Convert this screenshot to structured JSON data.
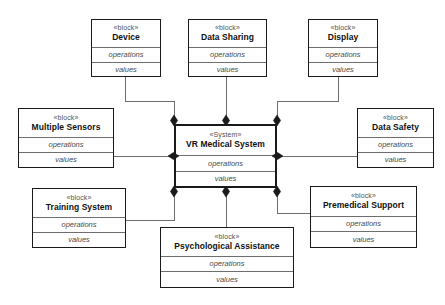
{
  "diagram": {
    "notation": "SysML Block Definition Diagram",
    "background_color": "#ffffff",
    "line_color": "#6e6e6e",
    "border_color": "#1a1a1a",
    "text_color": "#2b2b2b",
    "labels": {
      "stereotype_block": "«block»",
      "stereotype_system": "«System»",
      "operations": "operations",
      "values": "values"
    },
    "blocks": [
      {
        "id": "device",
        "stereotype": "«block»",
        "name": "Device",
        "operations": "operations",
        "values": "values",
        "x": 91,
        "y": 19,
        "w": 70,
        "h": 58,
        "role": "part"
      },
      {
        "id": "data-sharing",
        "stereotype": "«block»",
        "name": "Data Sharing",
        "operations": "operations",
        "values": "values",
        "x": 188,
        "y": 19,
        "w": 79,
        "h": 58,
        "role": "part"
      },
      {
        "id": "display",
        "stereotype": "«block»",
        "name": "Display",
        "operations": "operations",
        "values": "values",
        "x": 308,
        "y": 19,
        "w": 70,
        "h": 58,
        "role": "part"
      },
      {
        "id": "multiple-sensors",
        "stereotype": "«block»",
        "name": "Multiple Sensors",
        "operations": "operations",
        "values": "values",
        "x": 18,
        "y": 108,
        "w": 96,
        "h": 60,
        "role": "part"
      },
      {
        "id": "vr-medical-system",
        "stereotype": "«System»",
        "name": "VR Medical System",
        "operations": "operations",
        "values": "values",
        "x": 174,
        "y": 124,
        "w": 103,
        "h": 64,
        "role": "system"
      },
      {
        "id": "data-safety",
        "stereotype": "«block»",
        "name": "Data Safety",
        "operations": "operations",
        "values": "values",
        "x": 357,
        "y": 108,
        "w": 77,
        "h": 60,
        "role": "part"
      },
      {
        "id": "training-system",
        "stereotype": "«block»",
        "name": "Training System",
        "operations": "operations",
        "values": "values",
        "x": 32,
        "y": 188,
        "w": 94,
        "h": 60,
        "role": "part"
      },
      {
        "id": "psychological-assistance",
        "stereotype": "«block»",
        "name": "Psychological Assistance",
        "operations": "operations",
        "values": "values",
        "x": 160,
        "y": 227,
        "w": 134,
        "h": 61,
        "role": "part"
      },
      {
        "id": "premedical-support",
        "stereotype": "«block»",
        "name": "Premedical Support",
        "operations": "operations",
        "values": "values",
        "x": 310,
        "y": 186,
        "w": 107,
        "h": 62,
        "role": "part"
      }
    ],
    "connections": [
      {
        "id": "device-to-system",
        "from": "device",
        "to": "vr-medical-system",
        "type": "composition",
        "diamond_end": "vr-medical-system",
        "path": "M 125 77 L 125 101 L 174 101 L 174 118",
        "diamond": {
          "x": 174,
          "y": 120.5,
          "orientation": "vertical"
        }
      },
      {
        "id": "data-sharing-to-system",
        "from": "data-sharing",
        "to": "vr-medical-system",
        "type": "composition",
        "diamond_end": "vr-medical-system",
        "path": "M 226 77 L 226 118",
        "diamond": {
          "x": 226,
          "y": 120.5,
          "orientation": "vertical"
        }
      },
      {
        "id": "display-to-system",
        "from": "display",
        "to": "vr-medical-system",
        "type": "composition",
        "diamond_end": "vr-medical-system",
        "path": "M 338 77 L 338 101 L 277 101 L 277 118",
        "diamond": {
          "x": 277,
          "y": 120.5,
          "orientation": "vertical"
        }
      },
      {
        "id": "multiple-sensors-to-system",
        "from": "multiple-sensors",
        "to": "vr-medical-system",
        "type": "composition",
        "diamond_end": "vr-medical-system",
        "path": "M 114 156 L 171 156",
        "diamond": {
          "x": 173.5,
          "y": 156,
          "orientation": "horizontal"
        }
      },
      {
        "id": "data-safety-to-system",
        "from": "data-safety",
        "to": "vr-medical-system",
        "type": "composition",
        "diamond_end": "vr-medical-system",
        "path": "M 357 156 L 280 156",
        "diamond": {
          "x": 277.5,
          "y": 156,
          "orientation": "horizontal"
        }
      },
      {
        "id": "training-system-to-system",
        "from": "training-system",
        "to": "vr-medical-system",
        "type": "composition",
        "diamond_end": "vr-medical-system",
        "path": "M 126 220 L 174 220 L 174 194",
        "diamond": {
          "x": 174,
          "y": 191.5,
          "orientation": "vertical"
        }
      },
      {
        "id": "psychological-assistance-to-system",
        "from": "psychological-assistance",
        "to": "vr-medical-system",
        "type": "composition",
        "diamond_end": "vr-medical-system",
        "path": "M 226 227 L 226 194",
        "diamond": {
          "x": 226,
          "y": 191.5,
          "orientation": "vertical"
        }
      },
      {
        "id": "premedical-support-to-system",
        "from": "premedical-support",
        "to": "vr-medical-system",
        "type": "composition",
        "diamond_end": "vr-medical-system",
        "path": "M 310 213 L 277 213 L 277 194",
        "diamond": {
          "x": 277,
          "y": 191.5,
          "orientation": "vertical"
        }
      }
    ]
  }
}
